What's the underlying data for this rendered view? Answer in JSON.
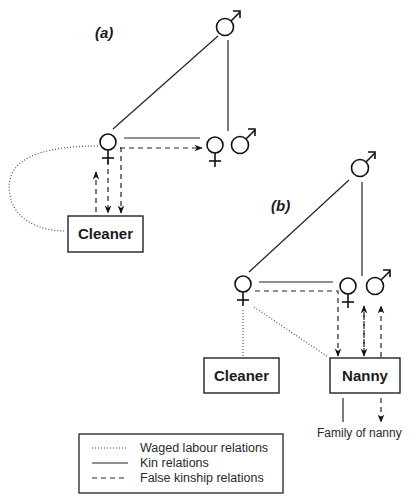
{
  "diagram": {
    "panel_a": {
      "label": "(a)",
      "nodes": {
        "male_top": "male",
        "female_employer": "female",
        "female_partner": "female",
        "male_partner": "male",
        "worker": "Cleaner"
      }
    },
    "panel_b": {
      "label": "(b)",
      "nodes": {
        "male_top": "male",
        "female_employer": "female",
        "female_partner": "female",
        "male_partner": "male",
        "worker_1": "Cleaner",
        "worker_2": "Nanny",
        "external": "Family of nanny"
      }
    },
    "legend": {
      "items": [
        {
          "style": "dotted",
          "label": "Waged labour relations"
        },
        {
          "style": "solid",
          "label": "Kin relations"
        },
        {
          "style": "dashed",
          "label": "False kinship relations"
        }
      ]
    },
    "symbols": {
      "male": "♂",
      "female": "♀"
    }
  }
}
